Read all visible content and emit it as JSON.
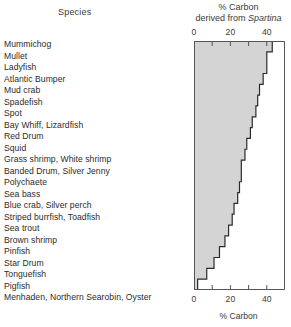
{
  "figure": {
    "species_header": "Species",
    "axis_title_line1": "% Carbon",
    "axis_title_line2_prefix": "derived from ",
    "axis_title_line2_italic": "Spartina",
    "xlabel": "% Carbon"
  },
  "chart_data": {
    "type": "area",
    "title": "% Carbon derived from Spartina",
    "xlabel": "% Carbon",
    "ylabel": "Species",
    "xlim": [
      0,
      50
    ],
    "xticks": [
      0,
      20,
      40
    ],
    "xtick_labels": [
      "0",
      "20",
      "40"
    ],
    "xminor_ticks": [
      10,
      30,
      50
    ],
    "grid": false,
    "legend": null,
    "orientation": "horizontal-step",
    "axis_top": true,
    "axis_bottom": true,
    "fill_color": "#d4d4d4",
    "line_color": "#2b2b2b",
    "categories": [
      "Mummichog",
      "Mullet",
      "Ladyfish",
      "Atlantic Bumper",
      "Mud crab",
      "Spadefish",
      "Spot",
      "Bay Whiff, Lizardfish",
      "Red Drum",
      "Squid",
      "Grass shrimp, White shrimp",
      "Banded Drum, Silver Jenny",
      "Polychaete",
      "Sea bass",
      "Blue crab, Silver perch",
      "Striped burrfish, Toadfish",
      "Sea trout",
      "Brown shrimp",
      "Pinfish",
      "Star Drum",
      "Tonguefish",
      "Pigfish",
      "Menhaden, Northern Searobin, Oyster"
    ],
    "values": [
      43,
      40,
      40,
      38,
      36,
      35,
      34,
      32,
      31,
      29,
      28,
      26,
      26,
      25,
      24,
      22,
      21,
      19,
      17,
      14,
      11,
      7,
      2
    ]
  }
}
